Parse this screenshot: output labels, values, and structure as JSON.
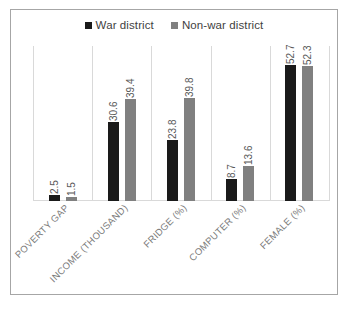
{
  "chart_data": {
    "type": "bar",
    "title": "",
    "subtitle": "",
    "xlabel": "",
    "ylabel": "",
    "grid": "vertical-category-separators",
    "legend_position": "top-center",
    "ylim": [
      0,
      60
    ],
    "axis_visible": false,
    "categories": [
      "POVERTY GAP",
      "INCOME (THOUSAND)",
      "FRIDGE (%)",
      "COMPUTER (%)",
      "FEMALE (%)"
    ],
    "series": [
      {
        "name": "War district",
        "color": "#1a1a1a",
        "values": [
          2.5,
          30.6,
          23.8,
          8.7,
          52.7
        ]
      },
      {
        "name": "Non-war district",
        "color": "#808080",
        "values": [
          1.5,
          39.4,
          39.8,
          13.6,
          52.3
        ]
      }
    ],
    "data_labels": [
      [
        "2.5",
        "1.5"
      ],
      [
        "30.6",
        "39.4"
      ],
      [
        "23.8",
        "39.8"
      ],
      [
        "8.7",
        "13.6"
      ],
      [
        "52.7",
        "52.3"
      ]
    ]
  },
  "legend": {
    "entries": [
      {
        "label": "War district",
        "color": "#1a1a1a"
      },
      {
        "label": "Non-war district",
        "color": "#808080"
      }
    ]
  },
  "colors": {
    "series_war": "#1a1a1a",
    "series_nonwar": "#808080",
    "gridline": "#d9d9d9",
    "border": "#a6a6a6",
    "label_text": "#7a7a7a",
    "value_text": "#595959",
    "legend_text": "#3f3f3f",
    "background": "#ffffff"
  }
}
